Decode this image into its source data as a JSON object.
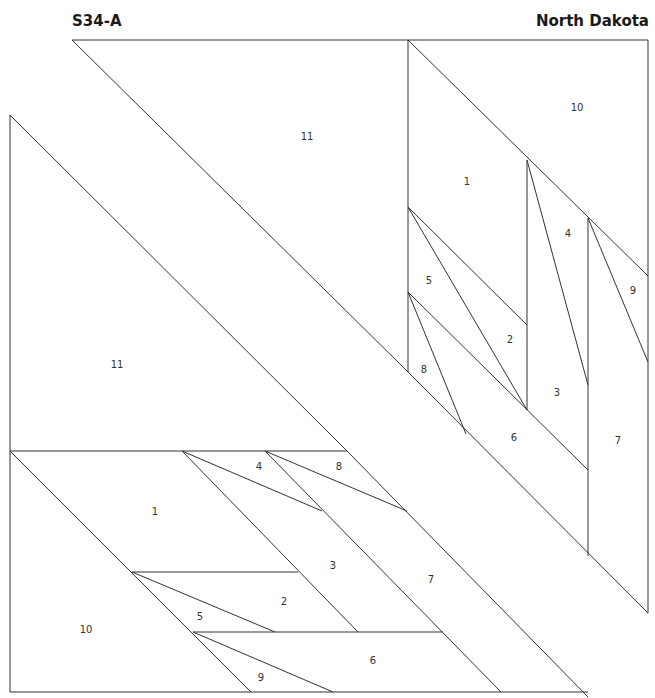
{
  "header": {
    "pattern_code": "S34-A",
    "state_name": "North Dakota"
  },
  "labels": {
    "upper_11": "11",
    "upper_10": "10",
    "upper_1": "1",
    "upper_4": "4",
    "upper_9": "9",
    "upper_5": "5",
    "upper_2": "2",
    "upper_8": "8",
    "upper_3": "3",
    "upper_6": "6",
    "upper_7": "7",
    "left_11": "11",
    "lower_4": "4",
    "lower_8": "8",
    "lower_1": "1",
    "lower_3": "3",
    "lower_7": "7",
    "lower_2": "2",
    "lower_10": "10",
    "lower_5": "5",
    "lower_6": "6",
    "lower_9": "9"
  }
}
